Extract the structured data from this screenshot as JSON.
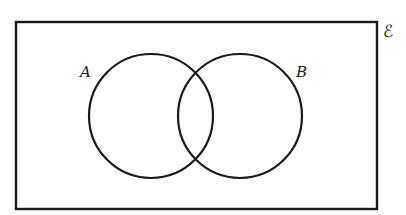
{
  "diagram": {
    "type": "venn",
    "universal_set_label": "ℰ",
    "sets": [
      {
        "id": "A",
        "label": "A"
      },
      {
        "id": "B",
        "label": "B"
      }
    ],
    "line_color": "#1a1a1a",
    "background": "#ffffff"
  }
}
